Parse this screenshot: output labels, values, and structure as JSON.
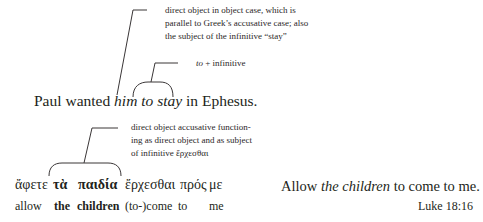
{
  "example1": {
    "annotation1": {
      "lines": [
        "direct object in object case, which is",
        "parallel to Greek’s accusative case; also",
        "the subject of the infinitive “stay”"
      ]
    },
    "annotation2": {
      "italic": "to",
      "rest": " + infinitive"
    },
    "sentence": {
      "before": "Paul wanted ",
      "italic1": "him",
      "space": " ",
      "italic2": "to stay",
      "after": " in Ephesus."
    }
  },
  "example2": {
    "annotation": {
      "lines": [
        "direct object accusative function-",
        "ing as direct object and as subject",
        "of infinitive ἔρχεσθαι"
      ]
    },
    "greek": {
      "w1": "ἄφετε",
      "w2": "τὰ",
      "w3": "παιδία",
      "w4": "ἔρχεσθαι",
      "w5": "πρός",
      "w6": "με"
    },
    "gloss": {
      "w1": "allow",
      "w2": "the",
      "w3": "children",
      "w4": "(to-)come",
      "w5": "to",
      "w6": "me"
    },
    "translation": {
      "before": "Allow ",
      "italic": "the children",
      "after": " to come to me."
    },
    "reference": "Luke 18:16"
  },
  "colors": {
    "text": "#231f20",
    "line": "#3a3637"
  }
}
